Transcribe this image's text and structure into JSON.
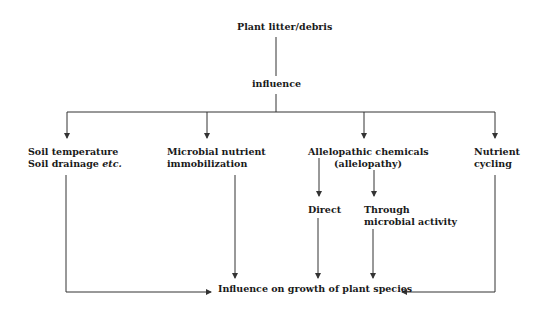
{
  "diagram": {
    "root": "Plant litter/debris",
    "connector": "influence",
    "factors": [
      {
        "line1": "Soil temperature",
        "line2_a": "Soil drainage ",
        "line2_italic": "etc."
      },
      {
        "line1": "Microbial nutrient",
        "line2": "immobilization"
      },
      {
        "line1": "Allelopathic chemicals",
        "line2": "(allelopathy)"
      },
      {
        "line1": "Nutrient",
        "line2": "cycling"
      }
    ],
    "allelopathy_branches": [
      {
        "line1": "Direct"
      },
      {
        "line1": "Through",
        "line2": "microbial activity"
      }
    ],
    "outcome": "Influence on growth of plant species",
    "colors": {
      "line": "#333333",
      "text": "#1a1a1a",
      "background": "#ffffff"
    }
  }
}
